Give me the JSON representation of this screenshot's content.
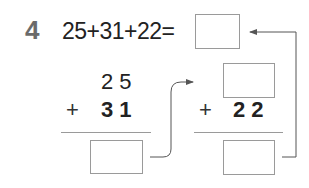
{
  "problem": {
    "number": "4",
    "equation": "25+31+22=",
    "answer_box_value": ""
  },
  "left_column": {
    "top_digits": "2 5",
    "operator": "+",
    "addend_digits": "3 1",
    "result_box_value": ""
  },
  "right_column": {
    "top_box_value": "",
    "operator": "+",
    "addend_digits": "2 2",
    "result_box_value": ""
  },
  "colors": {
    "text": "#222222",
    "number_label": "#6b6b6b",
    "lines": "#9a9a9a",
    "arrows": "#555555"
  }
}
